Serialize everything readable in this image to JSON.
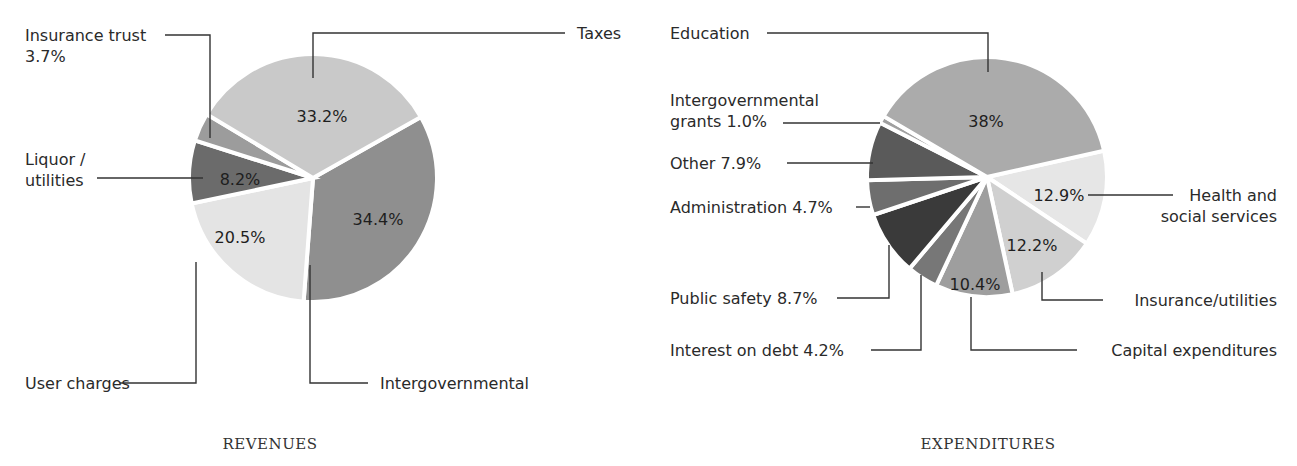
{
  "chart_data": [
    {
      "type": "pie",
      "title": "REVENUES",
      "start_angle_deg": 60.5,
      "slices": [
        {
          "label": "Intergovernmental",
          "value": 34.4,
          "value_label": "34.4%",
          "color": "#8f8f8f"
        },
        {
          "label": "User charges",
          "value": 20.5,
          "value_label": "20.5%",
          "color": "#e4e4e4"
        },
        {
          "label": "Liquor / utilities",
          "label_lines": [
            "Liquor /",
            "utilities"
          ],
          "value": 8.2,
          "value_label": "8.2%",
          "color": "#6b6b6b"
        },
        {
          "label": "Insurance trust",
          "label_lines": [
            "Insurance trust",
            "3.7%"
          ],
          "value": 3.7,
          "value_label": "",
          "color": "#9c9c9c"
        },
        {
          "label": "Taxes",
          "value": 33.2,
          "value_label": "33.2%",
          "color": "#c9c9c9"
        }
      ]
    },
    {
      "type": "pie",
      "title": "EXPENDITURES",
      "start_angle_deg": 77.3,
      "slices": [
        {
          "label": "Health and social services",
          "label_lines": [
            "Health and",
            "social services"
          ],
          "value": 12.9,
          "value_label": "12.9%",
          "color": "#e6e6e6"
        },
        {
          "label": "Insurance/utilities",
          "value": 12.2,
          "value_label": "12.2%",
          "color": "#d0d0d0"
        },
        {
          "label": "Capital expenditures",
          "value": 10.4,
          "value_label": "10.4%",
          "color": "#9e9e9e"
        },
        {
          "label": "Interest on debt",
          "label_lines": [
            "Interest on debt 4.2%"
          ],
          "value": 4.2,
          "value_label": "",
          "color": "#777777"
        },
        {
          "label": "Public safety",
          "label_lines": [
            "Public safety 8.7%"
          ],
          "value": 8.7,
          "value_label": "",
          "color": "#3a3a3a"
        },
        {
          "label": "Administration",
          "label_lines": [
            "Administration 4.7%"
          ],
          "value": 4.7,
          "value_label": "",
          "color": "#6e6e6e"
        },
        {
          "label": "Other",
          "label_lines": [
            "Other 7.9%"
          ],
          "value": 7.9,
          "value_label": "",
          "color": "#5a5a5a"
        },
        {
          "label": "Intergovernmental grants",
          "label_lines": [
            "Intergovernmental",
            "grants 1.0%"
          ],
          "value": 1.0,
          "value_label": "",
          "color": "#a0a0a0"
        },
        {
          "label": "Education",
          "value": 38,
          "value_label": "38%",
          "color": "#ababab"
        }
      ]
    }
  ]
}
